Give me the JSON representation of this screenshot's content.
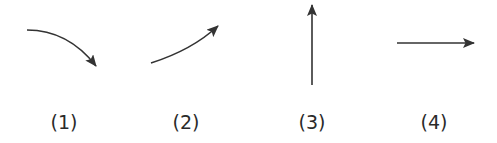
{
  "figure": {
    "stroke_color": "#333333",
    "items": [
      {
        "id": 1,
        "label": "(1)",
        "description": "curved arrow pointing down-right",
        "direction": "down-right",
        "shape": "curve"
      },
      {
        "id": 2,
        "label": "(2)",
        "description": "curved arrow pointing up-right",
        "direction": "up-right",
        "shape": "curve"
      },
      {
        "id": 3,
        "label": "(3)",
        "description": "straight arrow pointing up",
        "direction": "up",
        "shape": "straight"
      },
      {
        "id": 4,
        "label": "(4)",
        "description": "straight arrow pointing right",
        "direction": "right",
        "shape": "straight"
      }
    ]
  }
}
